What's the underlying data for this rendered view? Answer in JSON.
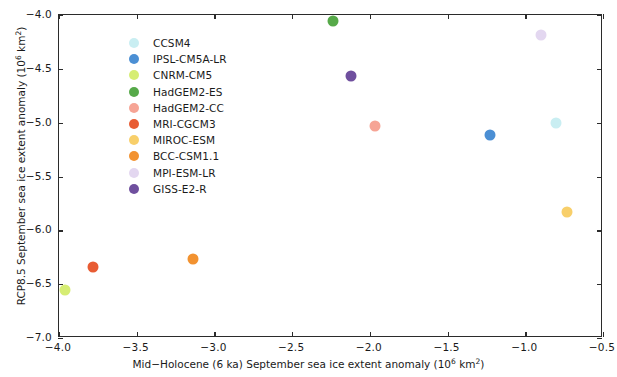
{
  "chart_data": {
    "type": "scatter",
    "title": "",
    "xlabel": "Mid−Holocene (6 ka) September sea ice extent anomaly (10⁶ km²)",
    "ylabel": "RCP8.5 September sea ice extent anomaly (10⁶ km²)",
    "xlabel_parts": {
      "pre": "Mid−Holocene (6 ka) September sea ice extent anomaly (10",
      "sup": "6",
      "post": " km",
      "sup2": "2",
      "post2": ")"
    },
    "ylabel_parts": {
      "pre": "RCP8.5 September sea ice extent anomaly (10",
      "sup": "6",
      "post": " km",
      "sup2": "2",
      "post2": ")"
    },
    "xlim": [
      -4.0,
      -0.5
    ],
    "ylim": [
      -7.0,
      -4.0
    ],
    "xticks": [
      -4.0,
      -3.5,
      -3.0,
      -2.5,
      -2.0,
      -1.5,
      -1.0,
      -0.5
    ],
    "yticks": [
      -4.0,
      -4.5,
      -5.0,
      -5.5,
      -6.0,
      -6.5,
      -7.0
    ],
    "xticklabels": [
      "−4.0",
      "−3.5",
      "−3.0",
      "−2.5",
      "−2.0",
      "−1.5",
      "−1.0",
      "−0.5"
    ],
    "yticklabels": [
      "−4.0",
      "−4.5",
      "−5.0",
      "−5.5",
      "−6.0",
      "−6.5",
      "−7.0"
    ],
    "grid": false,
    "legend_position": "upper-left-inside",
    "series": [
      {
        "name": "CCSM4",
        "color": "#c9eef2",
        "x": -0.8,
        "y": -5.0
      },
      {
        "name": "IPSL-CM5A-LR",
        "color": "#4b8fd4",
        "x": -1.23,
        "y": -5.11
      },
      {
        "name": "CNRM-CM5",
        "color": "#d6ed74",
        "x": -3.96,
        "y": -6.55
      },
      {
        "name": "HadGEM2-ES",
        "color": "#56a949",
        "x": -2.24,
        "y": -4.06
      },
      {
        "name": "HadGEM2-CC",
        "color": "#f6a495",
        "x": -1.97,
        "y": -5.03
      },
      {
        "name": "MRI-CGCM3",
        "color": "#e85c33",
        "x": -3.78,
        "y": -6.34
      },
      {
        "name": "MIROC-ESM",
        "color": "#f8cf6a",
        "x": -0.73,
        "y": -5.83
      },
      {
        "name": "BCC-CSM1.1",
        "color": "#f29230",
        "x": -3.14,
        "y": -6.27
      },
      {
        "name": "MPI-ESM-LR",
        "color": "#e3d7f0",
        "x": -0.9,
        "y": -4.19
      },
      {
        "name": "GISS-E2-R",
        "color": "#6f4f9e",
        "x": -2.12,
        "y": -4.57
      }
    ]
  },
  "legend": {
    "entries": [
      "CCSM4",
      "IPSL-CM5A-LR",
      "CNRM-CM5",
      "HadGEM2-ES",
      "HadGEM2-CC",
      "MRI-CGCM3",
      "MIROC-ESM",
      "BCC-CSM1.1",
      "MPI-ESM-LR",
      "GISS-E2-R"
    ]
  }
}
